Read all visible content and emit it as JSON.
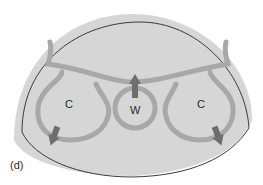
{
  "figure": {
    "panel_label": "(d)",
    "labels": {
      "left_cell": "C",
      "center_cell": "W",
      "right_cell": "C"
    },
    "colors": {
      "dome_fill": "#d6d6d6",
      "dome_outline": "#3a3a3a",
      "flow_tube": "#a8a8a8",
      "arrow": "#6e6e6e",
      "background": "#ffffff"
    }
  }
}
